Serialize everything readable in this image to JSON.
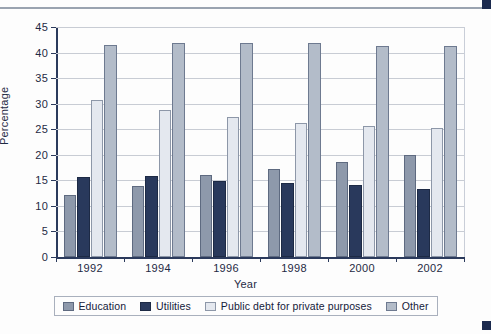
{
  "chart_data": {
    "type": "bar",
    "title": "",
    "subtitle": "",
    "xlabel": "Year",
    "ylabel": "Percentage",
    "categories": [
      "1992",
      "1994",
      "1996",
      "1998",
      "2000",
      "2002"
    ],
    "series": [
      {
        "name": "Education",
        "color": "#8e99ab",
        "values": [
          12.2,
          13.8,
          16.0,
          17.2,
          18.6,
          20.0
        ]
      },
      {
        "name": "Utilities",
        "color": "#29395c",
        "values": [
          15.7,
          15.8,
          14.9,
          14.5,
          14.0,
          13.3
        ]
      },
      {
        "name": "Public debt for private purposes",
        "color": "#e4e8ef",
        "values": [
          30.7,
          28.8,
          27.3,
          26.3,
          25.7,
          25.3
        ]
      },
      {
        "name": "Other",
        "color": "#b3bcc9",
        "values": [
          41.4,
          41.9,
          41.9,
          41.8,
          41.2,
          41.2
        ]
      }
    ],
    "ylim": [
      0,
      45
    ],
    "yticks": [
      0,
      5,
      10,
      15,
      20,
      25,
      30,
      35,
      40,
      45
    ],
    "ytick_labels": [
      "0",
      "5",
      "10",
      "15",
      "20",
      "25",
      "30",
      "35",
      "40",
      "45"
    ],
    "grid": "horizontal",
    "legend_position": "bottom"
  },
  "axis": {
    "y_label": "Percentage",
    "x_label": "Year"
  },
  "legend": {
    "items": [
      {
        "label": "Education"
      },
      {
        "label": "Utilities"
      },
      {
        "label": "Public debt for private purposes"
      },
      {
        "label": "Other"
      }
    ]
  }
}
